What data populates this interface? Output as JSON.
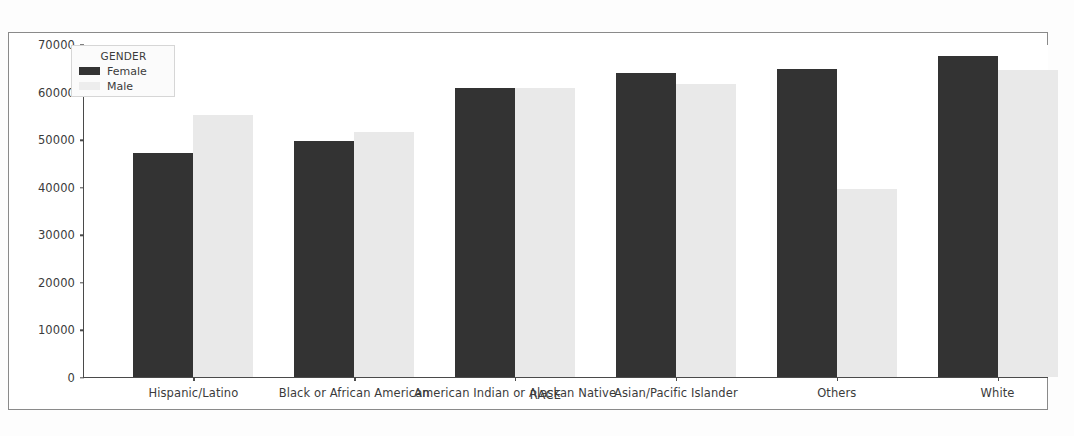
{
  "chart_data": {
    "type": "bar",
    "title": "",
    "xlabel": "RACE",
    "ylabel": "",
    "categories": [
      "Hispanic/Latino",
      "Black or African American",
      "American Indian or Alaskan Native",
      "Asian/Pacific Islander",
      "Others",
      "White"
    ],
    "series": [
      {
        "name": "Female",
        "color": "#333333",
        "values": [
          47000,
          49600,
          60800,
          63900,
          64700,
          67500
        ]
      },
      {
        "name": "Male",
        "color": "#e9e9e9",
        "values": [
          55000,
          51500,
          60800,
          61500,
          39500,
          64500
        ]
      }
    ],
    "ylim": [
      0,
      70000
    ],
    "yticks": [
      0,
      10000,
      20000,
      30000,
      40000,
      50000,
      60000,
      70000
    ],
    "ytick_labels": [
      "0",
      "10000",
      "20000",
      "30000",
      "40000",
      "50000",
      "60000",
      "70000"
    ],
    "grid": false,
    "legend": {
      "title": "GENDER",
      "position": "upper-left-inside",
      "entries": [
        {
          "label": "Female",
          "color": "#333333"
        },
        {
          "label": "Male",
          "color": "#ededed"
        }
      ]
    }
  }
}
